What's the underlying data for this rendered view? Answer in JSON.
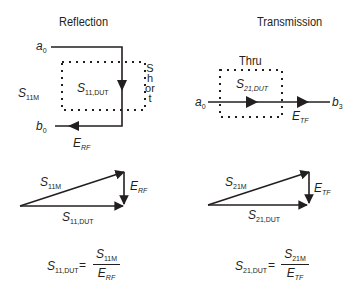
{
  "reflection": {
    "title": "Reflection",
    "incident_label": {
      "base": "a",
      "sub": "0"
    },
    "reflected_label": {
      "base": "b",
      "sub": "0"
    },
    "measured_label": {
      "base": "S",
      "sub": "11M"
    },
    "dut_label": {
      "base": "S",
      "sub": "11,DUT"
    },
    "error_label": {
      "base": "E",
      "sub": "RF"
    },
    "standard_label": "Short",
    "vector": {
      "measured": {
        "base": "S",
        "sub": "11M"
      },
      "dut": {
        "base": "S",
        "sub": "11,DUT"
      },
      "error": {
        "base": "E",
        "sub": "RF"
      }
    },
    "equation": {
      "lhs": {
        "base": "S",
        "sub": "11,DUT"
      },
      "equals": "=",
      "numerator": {
        "base": "S",
        "sub": "11M"
      },
      "denominator": {
        "base": "E",
        "sub": "RF"
      }
    }
  },
  "transmission": {
    "title": "Transmission",
    "standard_label": "Thru",
    "incident_label": {
      "base": "a",
      "sub": "0"
    },
    "output_label": {
      "base": "b",
      "sub": "3"
    },
    "dut_label": {
      "base": "S",
      "sub": "21,DUT"
    },
    "error_label": {
      "base": "E",
      "sub": "TF"
    },
    "vector": {
      "measured": {
        "base": "S",
        "sub": "21M"
      },
      "dut": {
        "base": "S",
        "sub": "21,DUT"
      },
      "error": {
        "base": "E",
        "sub": "TF"
      }
    },
    "equation": {
      "lhs": {
        "base": "S",
        "sub": "21,DUT"
      },
      "equals": "=",
      "numerator": {
        "base": "S",
        "sub": "21M"
      },
      "denominator": {
        "base": "E",
        "sub": "TF"
      }
    }
  },
  "colors": {
    "ink": "#231f20",
    "background": "#ffffff"
  }
}
